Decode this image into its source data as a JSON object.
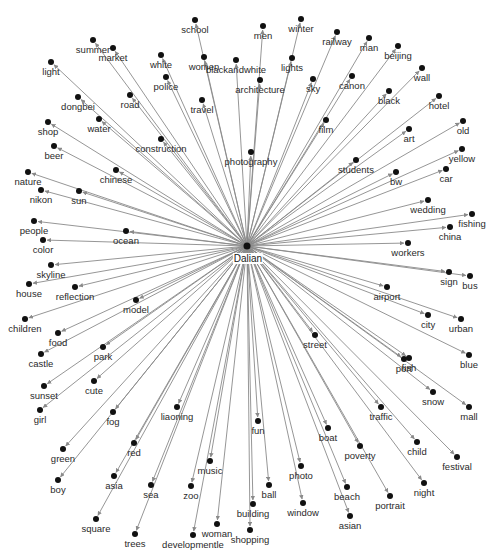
{
  "diagram": {
    "type": "radial-network",
    "hub": {
      "id": "Dalian",
      "label": "Dalian",
      "x": 247,
      "y": 246,
      "lx": 248,
      "ly": 253
    },
    "colors": {
      "edge": "#8a8a8a",
      "node": "#111111",
      "text": "#2a2a2a",
      "background": "#ffffff"
    },
    "nodes": [
      {
        "label": "school",
        "x": 195,
        "y": 20
      },
      {
        "label": "men",
        "x": 263,
        "y": 26
      },
      {
        "label": "winter",
        "x": 301,
        "y": 19
      },
      {
        "label": "railway",
        "x": 337,
        "y": 32
      },
      {
        "label": "man",
        "x": 369,
        "y": 38
      },
      {
        "label": "beijing",
        "x": 398,
        "y": 46
      },
      {
        "label": "summer",
        "x": 93,
        "y": 40
      },
      {
        "label": "market",
        "x": 113,
        "y": 48
      },
      {
        "label": "light",
        "x": 51,
        "y": 62
      },
      {
        "label": "white",
        "x": 161,
        "y": 55
      },
      {
        "label": "women",
        "x": 204,
        "y": 57
      },
      {
        "label": "blackandwhite",
        "x": 236,
        "y": 60
      },
      {
        "label": "lights",
        "x": 292,
        "y": 58
      },
      {
        "label": "architecture",
        "x": 260,
        "y": 80
      },
      {
        "label": "sky",
        "x": 313,
        "y": 79
      },
      {
        "label": "canon",
        "x": 352,
        "y": 76
      },
      {
        "label": "wall",
        "x": 422,
        "y": 68
      },
      {
        "label": "black",
        "x": 389,
        "y": 91
      },
      {
        "label": "hotel",
        "x": 439,
        "y": 96
      },
      {
        "label": "police",
        "x": 166,
        "y": 77
      },
      {
        "label": "road",
        "x": 130,
        "y": 95
      },
      {
        "label": "travel",
        "x": 202,
        "y": 100
      },
      {
        "label": "dongbei",
        "x": 78,
        "y": 97
      },
      {
        "label": "water",
        "x": 99,
        "y": 119
      },
      {
        "label": "shop",
        "x": 48,
        "y": 122
      },
      {
        "label": "construction",
        "x": 161,
        "y": 139
      },
      {
        "label": "film",
        "x": 326,
        "y": 120
      },
      {
        "label": "art",
        "x": 409,
        "y": 129
      },
      {
        "label": "old",
        "x": 463,
        "y": 121
      },
      {
        "label": "photography",
        "x": 251,
        "y": 152
      },
      {
        "label": "students",
        "x": 356,
        "y": 160
      },
      {
        "label": "bw",
        "x": 396,
        "y": 172
      },
      {
        "label": "yellow",
        "x": 462,
        "y": 149
      },
      {
        "label": "car",
        "x": 446,
        "y": 169
      },
      {
        "label": "beer",
        "x": 54,
        "y": 146
      },
      {
        "label": "chinese",
        "x": 116,
        "y": 170
      },
      {
        "label": "nature",
        "x": 28,
        "y": 172
      },
      {
        "label": "nikon",
        "x": 41,
        "y": 190
      },
      {
        "label": "sun",
        "x": 79,
        "y": 191
      },
      {
        "label": "people",
        "x": 34,
        "y": 221
      },
      {
        "label": "color",
        "x": 43,
        "y": 240
      },
      {
        "label": "ocean",
        "x": 126,
        "y": 231
      },
      {
        "label": "wedding",
        "x": 428,
        "y": 200
      },
      {
        "label": "fishing",
        "x": 472,
        "y": 214
      },
      {
        "label": "china",
        "x": 450,
        "y": 227
      },
      {
        "label": "workers",
        "x": 408,
        "y": 243
      },
      {
        "label": "skyline",
        "x": 51,
        "y": 265
      },
      {
        "label": "house",
        "x": 29,
        "y": 284
      },
      {
        "label": "reflection",
        "x": 75,
        "y": 287
      },
      {
        "label": "model",
        "x": 136,
        "y": 300
      },
      {
        "label": "children",
        "x": 25,
        "y": 319
      },
      {
        "label": "food",
        "x": 58,
        "y": 333
      },
      {
        "label": "castle",
        "x": 41,
        "y": 354
      },
      {
        "label": "park",
        "x": 103,
        "y": 347
      },
      {
        "label": "sunset",
        "x": 44,
        "y": 386
      },
      {
        "label": "cute",
        "x": 94,
        "y": 381
      },
      {
        "label": "girl",
        "x": 40,
        "y": 410
      },
      {
        "label": "sign",
        "x": 449,
        "y": 272
      },
      {
        "label": "bus",
        "x": 470,
        "y": 276
      },
      {
        "label": "airport",
        "x": 387,
        "y": 287
      },
      {
        "label": "city",
        "x": 428,
        "y": 315
      },
      {
        "label": "urban",
        "x": 461,
        "y": 319
      },
      {
        "label": "street",
        "x": 315,
        "y": 335
      },
      {
        "label": "port",
        "x": 404,
        "y": 359
      },
      {
        "label": "fish",
        "x": 409,
        "y": 358
      },
      {
        "label": "blue",
        "x": 469,
        "y": 355
      },
      {
        "label": "snow",
        "x": 433,
        "y": 392
      },
      {
        "label": "mall",
        "x": 469,
        "y": 407
      },
      {
        "label": "fog",
        "x": 113,
        "y": 412
      },
      {
        "label": "liaoning",
        "x": 177,
        "y": 407
      },
      {
        "label": "fun",
        "x": 258,
        "y": 421
      },
      {
        "label": "boat",
        "x": 328,
        "y": 428
      },
      {
        "label": "traffic",
        "x": 381,
        "y": 407
      },
      {
        "label": "child",
        "x": 417,
        "y": 442
      },
      {
        "label": "festival",
        "x": 457,
        "y": 457
      },
      {
        "label": "green",
        "x": 63,
        "y": 449
      },
      {
        "label": "red",
        "x": 134,
        "y": 443
      },
      {
        "label": "music",
        "x": 210,
        "y": 461
      },
      {
        "label": "photo",
        "x": 301,
        "y": 466
      },
      {
        "label": "poverty",
        "x": 360,
        "y": 446
      },
      {
        "label": "night",
        "x": 424,
        "y": 483
      },
      {
        "label": "ball",
        "x": 269,
        "y": 485
      },
      {
        "label": "beach",
        "x": 347,
        "y": 487
      },
      {
        "label": "asian",
        "x": 350,
        "y": 516
      },
      {
        "label": "portrait",
        "x": 390,
        "y": 496
      },
      {
        "label": "window",
        "x": 303,
        "y": 503
      },
      {
        "label": "boy",
        "x": 58,
        "y": 480
      },
      {
        "label": "asia",
        "x": 114,
        "y": 476
      },
      {
        "label": "sea",
        "x": 151,
        "y": 485
      },
      {
        "label": "zoo",
        "x": 191,
        "y": 486
      },
      {
        "label": "building",
        "x": 253,
        "y": 504
      },
      {
        "label": "square",
        "x": 96,
        "y": 519
      },
      {
        "label": "trees",
        "x": 135,
        "y": 534
      },
      {
        "label": "developmentle",
        "x": 193,
        "y": 535
      },
      {
        "label": "woman",
        "x": 217,
        "y": 524
      },
      {
        "label": "shopping",
        "x": 250,
        "y": 530
      }
    ]
  }
}
